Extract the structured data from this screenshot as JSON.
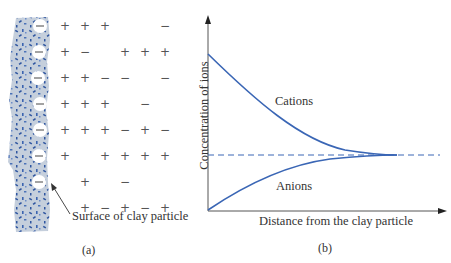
{
  "panel_a": {
    "caption": "(a)",
    "surface_label": "Surface of clay particle",
    "surface_charge_symbol": "−",
    "particle_colors": {
      "fill": "#c5cfdc",
      "speckle": "#2e55a0",
      "charge_circle": "#ffffff"
    },
    "ion_grid_columns_x": [
      65,
      85,
      105,
      125,
      145,
      165
    ],
    "ion_grid_rows": [
      {
        "y": 26,
        "signs": [
          "+",
          "+",
          "+",
          "",
          "",
          "−"
        ]
      },
      {
        "y": 52,
        "signs": [
          "+",
          "−",
          "",
          "+",
          "+",
          "+"
        ]
      },
      {
        "y": 78,
        "signs": [
          "+",
          "+",
          "−",
          "−",
          "",
          "−"
        ]
      },
      {
        "y": 104,
        "signs": [
          "+",
          "+",
          "+",
          "",
          "−",
          ""
        ]
      },
      {
        "y": 130,
        "signs": [
          "+",
          "+",
          "+",
          "−",
          "+",
          "−"
        ]
      },
      {
        "y": 156,
        "signs": [
          "+",
          "",
          "+",
          "+",
          "+",
          "+"
        ]
      },
      {
        "y": 182,
        "signs": [
          "",
          "+",
          "",
          "−",
          "",
          ""
        ]
      },
      {
        "y": 208,
        "signs": [
          "",
          "+",
          "−",
          "+",
          "−",
          "+"
        ]
      }
    ]
  },
  "panel_b": {
    "caption": "(b)",
    "x_axis_label": "Distance from the clay particle",
    "y_axis_label": "Concentration of ions",
    "curve_color": "#3a66b5",
    "curves": [
      {
        "name": "Cations",
        "label": "Cations"
      },
      {
        "name": "Anions",
        "label": "Anions"
      }
    ]
  },
  "chart_data": {
    "type": "line",
    "title": "",
    "xlabel": "Distance from the clay particle",
    "ylabel": "Concentration of ions",
    "grid": false,
    "ticks": "none",
    "x": [
      0,
      0.1,
      0.2,
      0.3,
      0.4,
      0.5,
      0.6,
      0.7,
      0.8,
      0.9,
      1.0
    ],
    "series": [
      {
        "name": "Cations",
        "values": [
          0.82,
          0.66,
          0.54,
          0.45,
          0.38,
          0.33,
          0.31,
          0.295,
          0.29,
          0.29,
          0.29
        ]
      },
      {
        "name": "Anions",
        "values": [
          0.0,
          0.11,
          0.18,
          0.23,
          0.26,
          0.275,
          0.285,
          0.29,
          0.29,
          0.29,
          0.29
        ]
      },
      {
        "name": "Equilibrium concentration (dashed)",
        "values": [
          0.29,
          0.29,
          0.29,
          0.29,
          0.29,
          0.29,
          0.29,
          0.29,
          0.29,
          0.29,
          0.29
        ]
      }
    ],
    "annotations": [
      "Cations",
      "Anions"
    ]
  }
}
